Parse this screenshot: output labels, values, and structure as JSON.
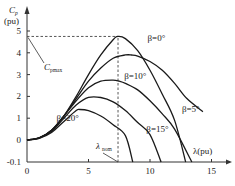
{
  "chart_data": {
    "type": "line",
    "title": "",
    "xlabel": "λ(pu)",
    "ylabel": "Cp (pu)",
    "ylabel_main": "C",
    "ylabel_sub": "p",
    "ylabel_unit": "(pu)",
    "xlim": [
      0,
      16
    ],
    "ylim": [
      -0.1,
      5.3
    ],
    "x_ticks": [
      0,
      5,
      10,
      15
    ],
    "x_tick_labels": [
      "0",
      "5",
      "10",
      "15"
    ],
    "y_ticks": [
      -0.1,
      0,
      1,
      2,
      3,
      4,
      5
    ],
    "y_tick_labels": [
      "-0.1",
      "0",
      "1",
      "2",
      "3",
      "4",
      "5"
    ],
    "grid": false,
    "series": [
      {
        "name": "β=0°",
        "x": [
          0,
          1,
          2,
          3,
          4,
          5,
          6,
          7,
          7.4,
          8,
          9,
          10,
          11,
          12,
          12.9
        ],
        "values": [
          0,
          0.1,
          0.45,
          1.1,
          2.0,
          3.0,
          3.9,
          4.6,
          4.75,
          4.65,
          4.1,
          3.2,
          2.1,
          0.9,
          -0.1
        ]
      },
      {
        "name": "β=5°",
        "x": [
          0,
          1,
          2,
          3,
          4,
          5,
          6,
          7,
          8,
          8.5,
          9,
          10,
          11,
          12,
          13,
          14.3
        ],
        "values": [
          0,
          0.1,
          0.45,
          1.1,
          1.9,
          2.7,
          3.3,
          3.75,
          3.9,
          3.9,
          3.85,
          3.6,
          3.2,
          2.6,
          1.9,
          1.3
        ]
      },
      {
        "name": "β=10°",
        "x": [
          0,
          1,
          2,
          3,
          4,
          5,
          6,
          7,
          7.5,
          8,
          9,
          10,
          11,
          12,
          13.4
        ],
        "values": [
          0,
          0.1,
          0.45,
          1.1,
          1.8,
          2.4,
          2.7,
          2.75,
          2.7,
          2.6,
          2.3,
          1.8,
          1.2,
          0.5,
          -0.1
        ]
      },
      {
        "name": "β=15°",
        "x": [
          0,
          1,
          2,
          3,
          4,
          5,
          6,
          7,
          8,
          9,
          10,
          10.9
        ],
        "values": [
          0,
          0.1,
          0.4,
          1.0,
          1.6,
          1.95,
          1.95,
          1.75,
          1.35,
          0.8,
          0.25,
          -0.1
        ]
      },
      {
        "name": "β=20°",
        "x": [
          0,
          1,
          2,
          3,
          4,
          4.3,
          5,
          6,
          7,
          8,
          8.6
        ],
        "values": [
          0,
          0.08,
          0.35,
          0.85,
          1.35,
          1.4,
          1.35,
          1.1,
          0.7,
          0.2,
          -0.1
        ]
      }
    ],
    "annotations": [
      {
        "text": "Cpmax",
        "main": "C",
        "sub": "pmax",
        "points_to": [
          0,
          4.75
        ]
      },
      {
        "text": "λnom",
        "main": "λ",
        "sub": "nom",
        "points_to": [
          7.4,
          -0.1
        ]
      }
    ],
    "reference_lines": [
      {
        "type": "horizontal",
        "y": 4.75,
        "x_range": [
          0,
          7.4
        ],
        "style": "dashed"
      },
      {
        "type": "vertical",
        "x": 7.4,
        "y_range": [
          -0.1,
          4.75
        ],
        "style": "dashed"
      }
    ],
    "labels": [
      {
        "text": "β=0°",
        "x": 9.8,
        "y": 4.55
      },
      {
        "text": "β=5°",
        "x": 12.6,
        "y": 1.3
      },
      {
        "text": "β=10°",
        "x": 7.9,
        "y": 2.8
      },
      {
        "text": "β=15°",
        "x": 9.7,
        "y": 0.35
      },
      {
        "text": "β=20°",
        "x": 2.4,
        "y": 0.85
      }
    ]
  }
}
